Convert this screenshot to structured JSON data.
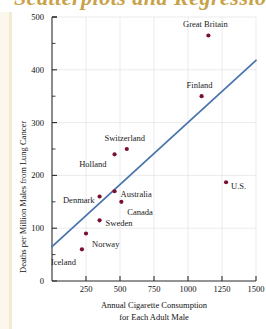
{
  "figure": {
    "cut_off_heading": "Scatterplots and Regression",
    "accent_heading_color": "#c8a24a",
    "point_color": "#7a1030",
    "line_color": "#4a76ad",
    "grid_color": "#e2e2e2",
    "axis_color": "#2b2b2b"
  },
  "chart_data": {
    "type": "scatter",
    "title": "",
    "xlabel": "Annual Cigarette Consumption",
    "xlabel_line2": "for Each Adult Male",
    "ylabel": "Deaths per Million Males from Lung Cancer",
    "xlim": [
      0,
      1500
    ],
    "ylim": [
      0,
      500
    ],
    "xticks": [
      250,
      500,
      750,
      1000,
      1250,
      1500
    ],
    "xtick_labels": [
      "250",
      "500",
      "750",
      "1000",
      "1250",
      "1500"
    ],
    "yticks": [
      0,
      100,
      200,
      300,
      400,
      500
    ],
    "ytick_labels": [
      "0",
      "100",
      "200",
      "300",
      "400",
      "500"
    ],
    "y_minor_ticks": [
      50,
      150,
      250,
      350,
      450
    ],
    "grid": true,
    "legend": "none",
    "points": [
      {
        "label": "Great Britain",
        "x": 1150,
        "y": 465,
        "label_dx": -3,
        "label_dy": -11,
        "label_anchor": "middle"
      },
      {
        "label": "Finland",
        "x": 1100,
        "y": 350,
        "label_dx": -2,
        "label_dy": -11,
        "label_anchor": "middle"
      },
      {
        "label": "U.S.",
        "x": 1280,
        "y": 187,
        "label_dx": 5,
        "label_dy": 4,
        "label_anchor": "start"
      },
      {
        "label": "Switzerland",
        "x": 550,
        "y": 250,
        "label_dx": -2,
        "label_dy": -11,
        "label_anchor": "middle"
      },
      {
        "label": "Holland",
        "x": 460,
        "y": 240,
        "label_dx": -8,
        "label_dy": 10,
        "label_anchor": "end"
      },
      {
        "label": "Denmark",
        "x": 350,
        "y": 160,
        "label_dx": -5,
        "label_dy": 3,
        "label_anchor": "end"
      },
      {
        "label": "Australia",
        "x": 460,
        "y": 170,
        "label_dx": 6,
        "label_dy": 3,
        "label_anchor": "start"
      },
      {
        "label": "Canada",
        "x": 510,
        "y": 150,
        "label_dx": 6,
        "label_dy": 10,
        "label_anchor": "start"
      },
      {
        "label": "Sweden",
        "x": 350,
        "y": 115,
        "label_dx": 6,
        "label_dy": 3,
        "label_anchor": "start"
      },
      {
        "label": "Norway",
        "x": 250,
        "y": 90,
        "label_dx": 6,
        "label_dy": 11,
        "label_anchor": "start"
      },
      {
        "label": "Iceland",
        "x": 220,
        "y": 60,
        "label_dx": -6,
        "label_dy": 13,
        "label_anchor": "end"
      }
    ],
    "regression_line": {
      "name": "least-squares regression line",
      "x1": 0,
      "y1": 65,
      "x2": 1500,
      "y2": 418
    }
  }
}
